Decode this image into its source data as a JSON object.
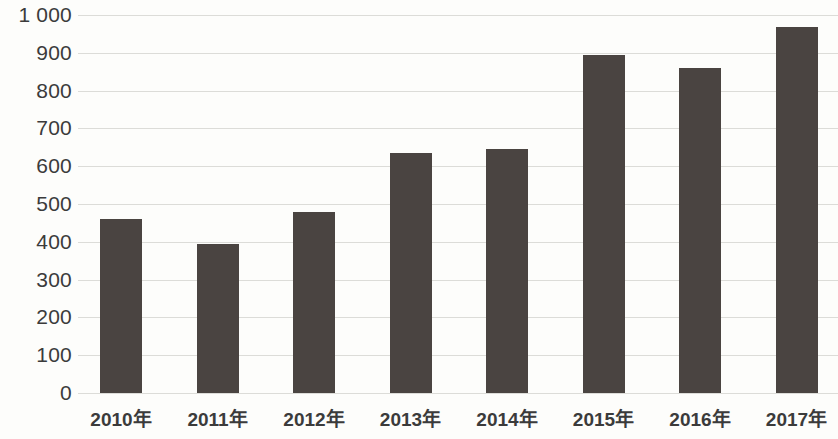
{
  "chart_data": {
    "type": "bar",
    "title": "",
    "subtitle": "",
    "xlabel": "",
    "ylabel": "",
    "categories": [
      "2010年",
      "2011年",
      "2012年",
      "2013年",
      "2014年",
      "2015年",
      "2016年",
      "2017年"
    ],
    "values": [
      460,
      393,
      480,
      635,
      645,
      895,
      860,
      967
    ],
    "ylim": [
      0,
      1000
    ],
    "y_ticks": [
      0,
      100,
      200,
      300,
      400,
      500,
      600,
      700,
      800,
      900,
      1000
    ],
    "y_tick_labels": [
      "0",
      "100",
      "200",
      "300",
      "400",
      "500",
      "600",
      "700",
      "800",
      "900",
      "1 000"
    ],
    "grid": true,
    "legend": null,
    "legend_position": "none",
    "series": [
      {
        "name": "",
        "values": [
          460,
          393,
          480,
          635,
          645,
          895,
          860,
          967
        ]
      }
    ],
    "annotations": []
  },
  "style": {
    "bar_color": "#4a4441",
    "grid_color": "#dcdcd8",
    "background_color": "#fdfdfb",
    "text_color": "#3b3b3b"
  }
}
